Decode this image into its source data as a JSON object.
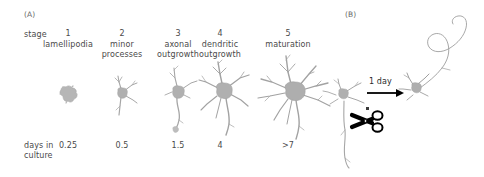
{
  "figure": {
    "panel_a_label": "(A)",
    "panel_b_label": "(B)",
    "stage_row_label": "stage",
    "days_row_label_line1": "days in",
    "days_row_label_line2": "culture",
    "ink_color": "#4a4a4a",
    "cell_color": "#b3b3b3",
    "neurite_color": "#9a9a9a",
    "arrow_color": "#000000"
  },
  "stages": [
    {
      "number": "1",
      "name_line1": "lamellipodia",
      "name_line2": "",
      "days": "0.25",
      "icon": "neuron-stage1-lamellipodia"
    },
    {
      "number": "2",
      "name_line1": "minor",
      "name_line2": "processes",
      "days": "0.5",
      "icon": "neuron-stage2-minor-processes"
    },
    {
      "number": "3",
      "name_line1": "axonal",
      "name_line2": "outgrowth",
      "days": "1.5",
      "icon": "neuron-stage3-axonal-outgrowth"
    },
    {
      "number": "4",
      "name_line1": "dendritic",
      "name_line2": "outgrowth",
      "days": "4",
      "icon": "neuron-stage4-dendritic-outgrowth"
    },
    {
      "number": "5",
      "name_line1": "maturation",
      "name_line2": "",
      "days": ">7",
      "icon": "neuron-stage5-maturation"
    }
  ],
  "panel_b": {
    "arrow_label": "1 day",
    "cut_icon": "scissors-icon",
    "before_icon": "neuron-before-axotomy",
    "after_icon": "neuron-after-regeneration"
  }
}
